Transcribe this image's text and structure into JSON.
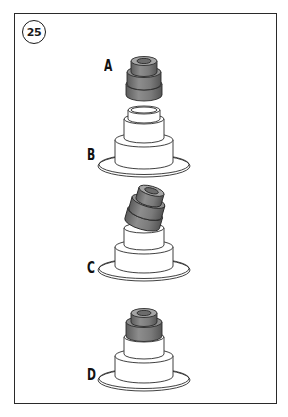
{
  "figure": {
    "step_number": "25",
    "labels": {
      "a": "A",
      "b": "B",
      "c": "C",
      "d": "D"
    },
    "parts": [
      {
        "id": "A",
        "description": "valve stem seal (dark grey, ribbed cylinder)"
      },
      {
        "id": "B",
        "description": "seal installer / valve guide base (stepped flange, outline)"
      },
      {
        "id": "C",
        "description": "seal tilted while being seated onto base"
      },
      {
        "id": "D",
        "description": "seal fully seated on base"
      }
    ],
    "colors": {
      "seal_dark": "#6e6e6e",
      "seal_mid": "#8a8a8a",
      "seal_light": "#a9a9a9",
      "outline": "#2b2b2b",
      "frame": "#2a2a2a"
    }
  }
}
